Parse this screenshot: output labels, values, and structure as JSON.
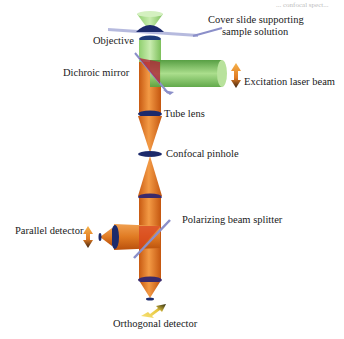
{
  "diagram": {
    "title_fragment": "... confocal spect...",
    "labels": {
      "cover_slide_line1": "Cover slide supporting",
      "cover_slide_line2": "sample solution",
      "objective": "Objective",
      "dichroic_mirror": "Dichroic mirror",
      "excitation_laser_beam": "Excitation laser beam",
      "tube_lens": "Tube lens",
      "confocal_pinhole": "Confocal pinhole",
      "polarizing_beam_splitter": "Polarizing beam splitter",
      "parallel_detector": "Parallel detector",
      "orthogonal_detector": "Orthogonal detector"
    },
    "colors": {
      "emission_beam": "#e07a22",
      "excitation_beam": "#7fc25a",
      "lens": "#1c2a6b",
      "mirror": "#8b8fc9",
      "cover_slide": "#a9acd6",
      "splitter_red": "#d8401f"
    }
  }
}
